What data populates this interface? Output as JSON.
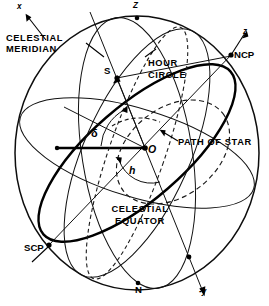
{
  "figure": {
    "kind": "celestial-sphere-diagram",
    "background_color": "#ffffff",
    "ink_color": "#000000"
  },
  "labels": {
    "axis_x": "x",
    "axis_z_top": "Z",
    "axis_z_ncp": "z",
    "axis_minus_y": "-y",
    "celestial_meridian_line1": "CELESTIAL",
    "celestial_meridian_line2": "MERIDIAN",
    "hour_circle_line1": "HOUR",
    "hour_circle_line2": "CIRCLE",
    "celestial_equator_line1": "CELESTIAL",
    "celestial_equator_line2": "EQUATOR",
    "path_of_star": "PATH OF STAR",
    "ncp": "NCP",
    "scp": "SCP",
    "north_point": "N",
    "star": "S",
    "observer": "O",
    "declination": "δ",
    "hour_angle": "h"
  }
}
